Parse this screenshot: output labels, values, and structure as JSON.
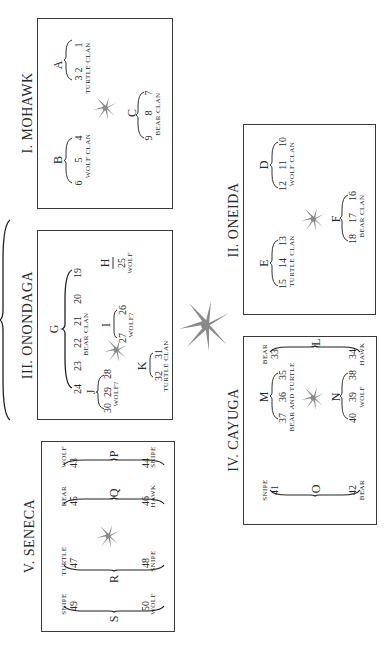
{
  "nations": {
    "mohawk": {
      "title": "I. MOHAWK",
      "groups": [
        {
          "label": "A",
          "numbers": [
            "3",
            "2",
            "1"
          ],
          "clan": "TURTLE  CLAN"
        },
        {
          "label": "B",
          "numbers": [
            "6",
            "5",
            "4"
          ],
          "clan": "WOLF  CLAN"
        },
        {
          "label": "C",
          "numbers": [
            "9",
            "8",
            "7"
          ],
          "clan": "BEAR  CLAN"
        }
      ]
    },
    "oneida": {
      "title": "II. ONEIDA",
      "groups": [
        {
          "label": "D",
          "numbers": [
            "12",
            "11",
            "10"
          ],
          "clan": "WOLF  CLAN"
        },
        {
          "label": "E",
          "numbers": [
            "15",
            "14",
            "13"
          ],
          "clan": "TURTLE  CLAN"
        },
        {
          "label": "F",
          "numbers": [
            "18",
            "17",
            "16"
          ],
          "clan": "BEAR  CLAN"
        }
      ]
    },
    "onondaga": {
      "title": "III. ONONDAGA",
      "groups": [
        {
          "label": "G",
          "numbers": [
            "24",
            "23",
            "22",
            "21",
            "20",
            "19"
          ],
          "clan": "BEAR  CLAN"
        },
        {
          "label": "H",
          "numbers": [
            "25"
          ],
          "clan": "WOLF"
        },
        {
          "label": "I",
          "numbers": [
            "27",
            "26"
          ],
          "clan": "WOLF?"
        },
        {
          "label": "J",
          "numbers": [
            "30",
            "29",
            "28"
          ],
          "clan": "WOLF?"
        },
        {
          "label": "K",
          "numbers": [
            "32",
            "31"
          ],
          "clan": "TURTLE  CLAN"
        }
      ]
    },
    "cayuga": {
      "title": "IV. CAYUGA",
      "groups": [
        {
          "label": "L",
          "numbers": [
            "33",
            "34"
          ],
          "clans": [
            "BEAR",
            "HAWK"
          ]
        },
        {
          "label": "M",
          "numbers": [
            "37",
            "36",
            "35"
          ],
          "clan": "BEAR  AND  TURTLE"
        },
        {
          "label": "N",
          "numbers": [
            "40",
            "39",
            "38"
          ],
          "clan": "WOLF"
        },
        {
          "label": "O",
          "numbers": [
            "41",
            "42"
          ],
          "clans": [
            "SNIPE",
            "BEAR"
          ]
        }
      ]
    },
    "seneca": {
      "title": "V. SENECA",
      "groups": [
        {
          "label": "P",
          "numbers": [
            "43",
            "44"
          ],
          "clans": [
            "WOLF",
            "SNIPE"
          ]
        },
        {
          "label": "Q",
          "numbers": [
            "45",
            "46"
          ],
          "clans": [
            "BEAR",
            "HAWK"
          ]
        },
        {
          "label": "R",
          "numbers": [
            "47",
            "48"
          ],
          "clans": [
            "TURTLE",
            "SNIPE"
          ]
        },
        {
          "label": "S",
          "numbers": [
            "49",
            "50"
          ],
          "clans": [
            "SNIPE",
            "WOLF"
          ]
        }
      ]
    }
  },
  "icons": {
    "small_tree": "tree-of-peace-icon",
    "central_tree": "great-tree-of-peace-icon"
  },
  "colors": {
    "tree": "#8a8a8a",
    "ink": "#2a2a2a",
    "border": "#3a3a3a"
  }
}
